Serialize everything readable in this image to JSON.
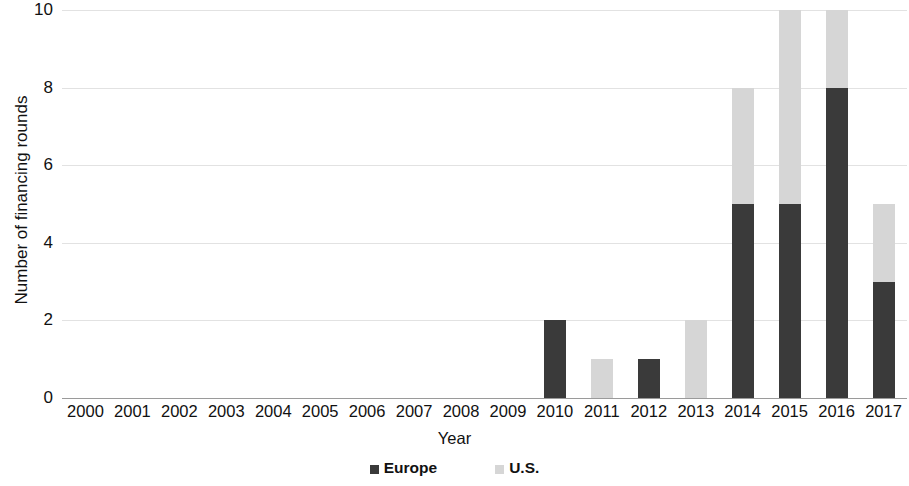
{
  "chart_data": {
    "type": "bar",
    "stacked": true,
    "title": "",
    "xlabel": "Year",
    "ylabel": "Number of financing rounds",
    "categories": [
      "2000",
      "2001",
      "2002",
      "2003",
      "2004",
      "2005",
      "2006",
      "2007",
      "2008",
      "2009",
      "2010",
      "2011",
      "2012",
      "2013",
      "2014",
      "2015",
      "2016",
      "2017"
    ],
    "series": [
      {
        "name": "Europe",
        "color": "#3a3a3a",
        "values": [
          0,
          0,
          0,
          0,
          0,
          0,
          0,
          0,
          0,
          0,
          2,
          0,
          1,
          0,
          5,
          5,
          8,
          3
        ]
      },
      {
        "name": "U.S.",
        "color": "#d6d6d6",
        "values": [
          0,
          0,
          0,
          0,
          0,
          0,
          0,
          0,
          0,
          0,
          0,
          1,
          0,
          2,
          3,
          5,
          2,
          2
        ]
      }
    ],
    "totals": [
      0,
      0,
      0,
      0,
      0,
      0,
      0,
      0,
      0,
      0,
      2,
      1,
      1,
      2,
      8,
      10,
      10,
      5
    ],
    "ylim": [
      0,
      10
    ],
    "yticks": [
      0,
      2,
      4,
      6,
      8,
      10
    ],
    "ytick_labels": [
      "0",
      "2",
      "4",
      "6",
      "8",
      "10"
    ],
    "grid": true,
    "grid_color": "#e2e2e2",
    "legend_position": "bottom",
    "legend": [
      "Europe",
      "U.S."
    ]
  }
}
